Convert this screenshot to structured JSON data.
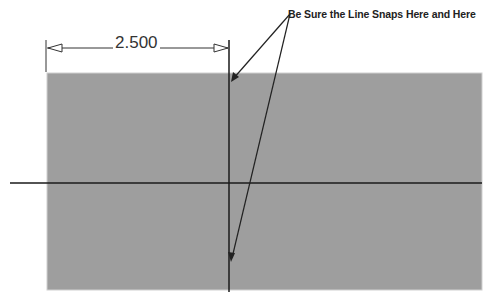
{
  "diagram": {
    "type": "cad-sketch",
    "dimension": {
      "value": "2.500"
    },
    "annotation": {
      "text": "Be Sure the Line Snaps Here and Here"
    },
    "colors": {
      "fill": "#9e9e9e",
      "line": "#1a1a1a",
      "background": "#ffffff"
    }
  }
}
